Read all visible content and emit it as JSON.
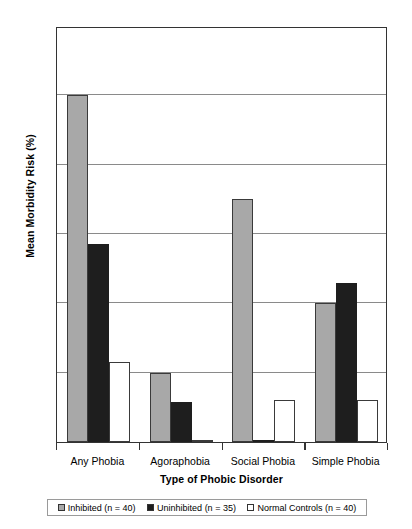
{
  "chart_data": {
    "type": "bar",
    "title": "",
    "xlabel": "Type of Phobic Disorder",
    "ylabel": "Mean Morbidity Risk (%)",
    "categories": [
      "Any Phobia",
      "Agoraphobia",
      "Social Phobia",
      "Simple Phobia"
    ],
    "series": [
      {
        "name": "Inhibited (n = 40)",
        "color": "#a8a8a8",
        "values": [
          25.0,
          5.0,
          17.5,
          10.0
        ]
      },
      {
        "name": "Uninhibited (n = 35)",
        "color": "#1e1e1e",
        "values": [
          14.3,
          2.9,
          0.1,
          11.5
        ]
      },
      {
        "name": "Normal Controls (n = 40)",
        "color": "#ffffff",
        "values": [
          5.8,
          0.1,
          3.0,
          3.0
        ]
      }
    ],
    "ylim": [
      0,
      30
    ],
    "yticks": [
      0,
      5,
      10,
      15,
      20,
      25,
      30
    ],
    "ytick_labels": [
      "0",
      "5",
      "10",
      "15",
      "20",
      "25",
      "30"
    ],
    "grid": "horizontal",
    "legend_position": "bottom"
  },
  "legend": {
    "entries": [
      {
        "label": "Inhibited (n = 40)"
      },
      {
        "label": "Uninhibited (n = 35)"
      },
      {
        "label": "Normal Controls (n = 40)"
      }
    ]
  }
}
